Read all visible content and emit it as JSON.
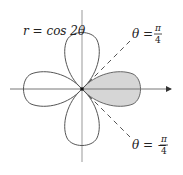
{
  "diagram": {
    "curve_label": "r = cos 2θ",
    "upper_line": {
      "label_lhs": "θ =",
      "num": "π",
      "den": "4"
    },
    "lower_line": {
      "label_lhs": "θ = −",
      "num": "π",
      "den": "4"
    },
    "colors": {
      "curve": "#555555",
      "axis": "#777777",
      "shade": "#d6d6d6",
      "dash": "#555555"
    }
  }
}
